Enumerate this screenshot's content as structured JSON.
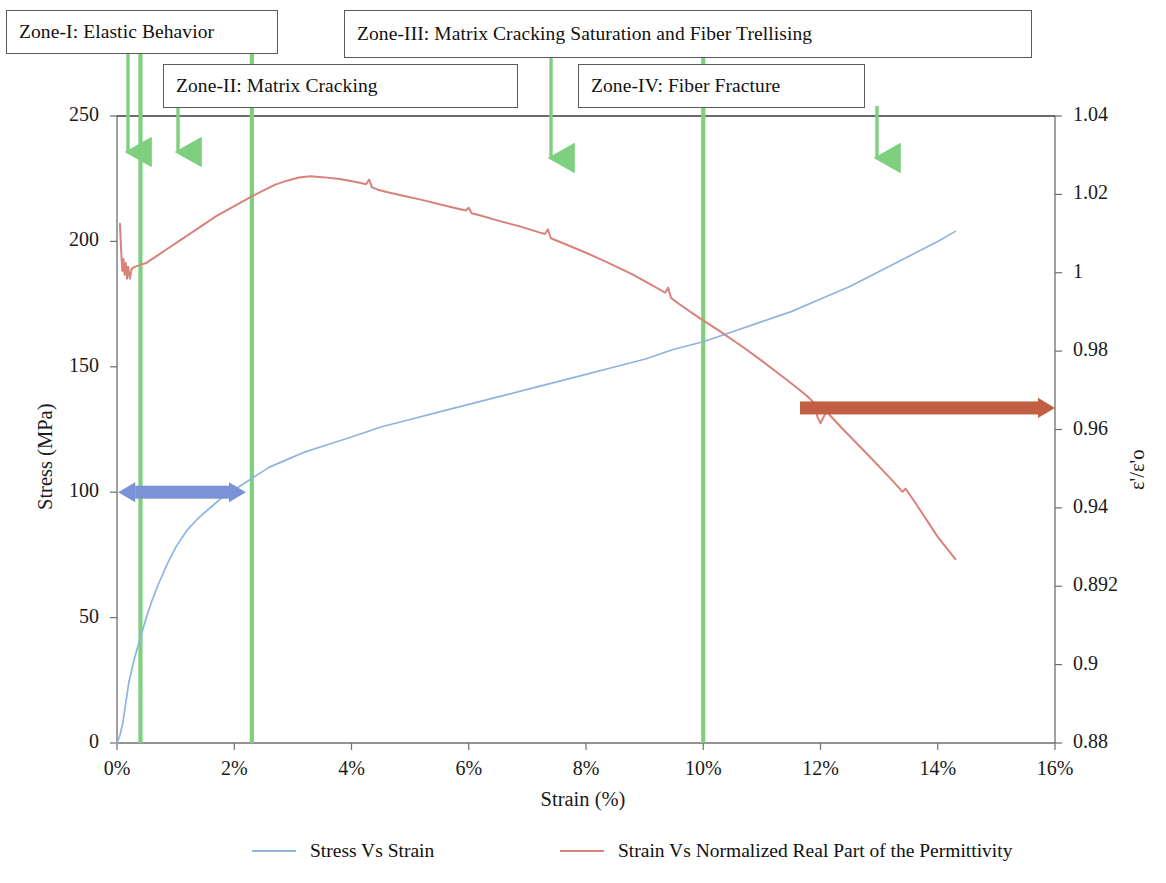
{
  "figure": {
    "background_color": "#ffffff"
  },
  "colors": {
    "stress_curve": "#8fb4dd",
    "permittivity_curve": "#d9827c",
    "zone_line": "#7ed07e",
    "zone_arrow": "#7ed07e",
    "blue_range_arrow": "#7b93d6",
    "red_range_arrow": "#c15f42",
    "axis": "#6f6f6f",
    "callout_border": "#5b5b5b",
    "text": "#111111"
  },
  "zone_callouts": [
    {
      "id": "zone-1",
      "label": "Zone-I: Elastic Behavior",
      "x": 6,
      "y": 10,
      "width": 272,
      "height": 44
    },
    {
      "id": "zone-3",
      "label": "Zone-III: Matrix Cracking Saturation and Fiber Trellising",
      "x": 344,
      "y": 10,
      "width": 688,
      "height": 48
    },
    {
      "id": "zone-2",
      "label": "Zone-II: Matrix Cracking",
      "x": 163,
      "y": 64,
      "width": 355,
      "height": 44
    },
    {
      "id": "zone-4",
      "label": "Zone-IV: Fiber Fracture",
      "x": 578,
      "y": 64,
      "width": 287,
      "height": 44
    }
  ],
  "zone_arrows": [
    {
      "id": "arrow-zone-1",
      "x": 128,
      "y_top": 52,
      "y_bottom": 152
    },
    {
      "id": "arrow-zone-2",
      "x": 178,
      "y_top": 106,
      "y_bottom": 152
    },
    {
      "id": "arrow-zone-3",
      "x": 551,
      "y_top": 57,
      "y_bottom": 158
    },
    {
      "id": "arrow-zone-4",
      "x": 877,
      "y_top": 106,
      "y_bottom": 158
    }
  ],
  "zone_divider_lines_strain_pct": [
    0.4,
    2.3,
    10.0
  ],
  "range_arrows": [
    {
      "id": "blue-zone-span",
      "color_key": "blue_range_arrow",
      "x_start_pct": 0.02,
      "x_end_pct": 2.2,
      "y_stress": 100,
      "head_left": true,
      "head_right": true,
      "thickness": 13
    },
    {
      "id": "red-zone-span",
      "color_key": "red_range_arrow",
      "x_start_pct": 11.65,
      "x_end_pct": 16.0,
      "y_permittivity": 0.9655,
      "head_left": false,
      "head_right": true,
      "thickness": 13
    }
  ],
  "chart_data": {
    "type": "line",
    "title": "",
    "subtitle": "",
    "xlabel": "Strain (%)",
    "ylabel": "Stress (MPa)",
    "y2label": "ε'/ε'o",
    "xlim": [
      0,
      16
    ],
    "ylim": [
      0,
      250
    ],
    "y2lim": [
      0.88,
      1.04
    ],
    "grid": false,
    "legend_position": "bottom",
    "x_ticks": [
      "0%",
      "2%",
      "4%",
      "6%",
      "8%",
      "10%",
      "12%",
      "14%",
      "16%"
    ],
    "x_tick_values": [
      0,
      2,
      4,
      6,
      8,
      10,
      12,
      14,
      16
    ],
    "y_ticks": [
      "0",
      "50",
      "100",
      "150",
      "200",
      "250"
    ],
    "y_tick_values": [
      0,
      50,
      100,
      150,
      200,
      250
    ],
    "y2_ticks": [
      "0.88",
      "0.9",
      "0.892",
      "0.94",
      "0.96",
      "0.98",
      "1",
      "1.02",
      "1.04"
    ],
    "y2_tick_values": [
      0.88,
      0.9,
      0.92,
      0.94,
      0.96,
      0.98,
      1.0,
      1.02,
      1.04
    ],
    "series": [
      {
        "name": "Stress Vs Strain",
        "axis": "left",
        "color_key": "stress_curve",
        "x": [
          0.0,
          0.05,
          0.1,
          0.15,
          0.2,
          0.3,
          0.4,
          0.5,
          0.6,
          0.7,
          0.85,
          1.0,
          1.2,
          1.4,
          1.6,
          1.8,
          2.0,
          2.2,
          2.4,
          2.6,
          2.9,
          3.2,
          3.6,
          4.0,
          4.5,
          5.0,
          5.5,
          6.0,
          6.5,
          7.0,
          7.5,
          8.0,
          8.5,
          9.0,
          9.5,
          10.0,
          10.5,
          11.0,
          11.5,
          12.0,
          12.5,
          13.0,
          13.5,
          14.0,
          14.3
        ],
        "y": [
          0,
          3,
          8,
          16,
          24,
          34,
          42,
          50,
          57,
          63,
          71,
          78,
          85,
          90,
          94,
          98,
          101,
          104,
          107,
          110,
          113,
          116,
          119,
          122,
          126,
          129,
          132,
          135,
          138,
          141,
          144,
          147,
          150,
          153,
          157,
          160,
          164,
          168,
          172,
          177,
          182,
          188,
          194,
          200,
          204
        ]
      },
      {
        "name": "Strain Vs Normalized Real Part of the Permittivity",
        "axis": "right",
        "color_key": "permittivity_curve",
        "x": [
          0.05,
          0.07,
          0.09,
          0.11,
          0.13,
          0.15,
          0.17,
          0.19,
          0.22,
          0.25,
          0.3,
          0.4,
          0.5,
          0.7,
          0.9,
          1.1,
          1.4,
          1.7,
          2.0,
          2.3,
          2.5,
          2.7,
          2.9,
          3.1,
          3.3,
          3.5,
          3.8,
          4.1,
          4.25,
          4.3,
          4.35,
          4.45,
          4.6,
          4.9,
          5.2,
          5.5,
          5.8,
          5.95,
          6.0,
          6.05,
          6.2,
          6.5,
          6.9,
          7.2,
          7.3,
          7.35,
          7.4,
          7.6,
          8.0,
          8.4,
          8.8,
          9.2,
          9.35,
          9.4,
          9.45,
          9.6,
          9.9,
          10.3,
          10.7,
          11.0,
          11.3,
          11.5,
          11.65,
          11.75,
          11.85,
          11.9,
          11.95,
          12.0,
          12.1,
          12.4,
          12.8,
          13.2,
          13.4,
          13.45,
          13.6,
          14.0,
          14.3
        ],
        "y": [
          1.0125,
          1.006,
          1.0005,
          1.0035,
          0.9995,
          1.0025,
          0.9985,
          1.0015,
          0.9985,
          1.001,
          1.0015,
          1.002,
          1.0025,
          1.0045,
          1.0065,
          1.0085,
          1.0115,
          1.0145,
          1.017,
          1.0195,
          1.021,
          1.0225,
          1.0235,
          1.0243,
          1.0246,
          1.0244,
          1.0239,
          1.0231,
          1.0226,
          1.0238,
          1.0218,
          1.0212,
          1.0206,
          1.0196,
          1.0186,
          1.0175,
          1.0164,
          1.0159,
          1.0166,
          1.0152,
          1.0146,
          1.0133,
          1.0117,
          1.0103,
          1.0099,
          1.0111,
          1.0088,
          1.0076,
          1.0051,
          1.0024,
          0.9995,
          0.9962,
          0.9949,
          0.9962,
          0.9936,
          0.9919,
          0.9888,
          0.9849,
          0.9808,
          0.9775,
          0.9741,
          0.9718,
          0.97,
          0.9688,
          0.9674,
          0.9665,
          0.9631,
          0.9616,
          0.9646,
          0.9598,
          0.9537,
          0.9474,
          0.9441,
          0.9449,
          0.9417,
          0.9326,
          0.9269
        ]
      }
    ],
    "legend": [
      {
        "label": "Stress Vs Strain",
        "color_key": "stress_curve"
      },
      {
        "label": "Strain Vs Normalized Real Part of the Permittivity",
        "color_key": "permittivity_curve"
      }
    ]
  }
}
